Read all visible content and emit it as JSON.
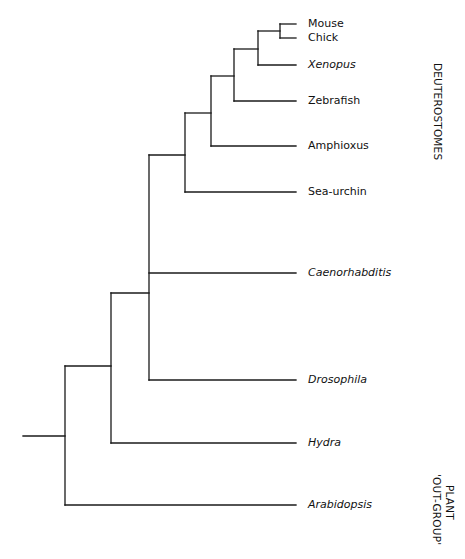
{
  "diagram": {
    "type": "phylogenetic-tree",
    "line_color": "#1a1a1a",
    "leaves": [
      {
        "label": "Mouse",
        "italic": false,
        "y": 24
      },
      {
        "label": "Chick",
        "italic": false,
        "y": 38
      },
      {
        "label": "Xenopus",
        "italic": true,
        "y": 65
      },
      {
        "label": "Zebrafish",
        "italic": false,
        "y": 101
      },
      {
        "label": "Amphioxus",
        "italic": false,
        "y": 146
      },
      {
        "label": "Sea-urchin",
        "italic": false,
        "y": 192
      },
      {
        "label": "Caenorhabditis",
        "italic": true,
        "y": 273
      },
      {
        "label": "Drosophila",
        "italic": true,
        "y": 380
      },
      {
        "label": "Hydra",
        "italic": true,
        "y": 443
      },
      {
        "label": "Arabidopsis",
        "italic": true,
        "y": 505
      }
    ],
    "group_labels": [
      {
        "label": "DEUTEROSTOMES"
      },
      {
        "line1": "PLANT",
        "line2": "'OUT-GROUP'"
      }
    ],
    "leaf_end_x": 296,
    "nodes": [
      {
        "name": "mouse-chick",
        "x": 280,
        "y_top": 24,
        "y_bottom": 38,
        "y_mid": 31
      },
      {
        "name": "amniote-xenopus",
        "x": 258,
        "y_top": 31,
        "y_bottom": 65,
        "y_mid": 49
      },
      {
        "name": "tetrapod-zebrafish",
        "x": 234,
        "y_top": 49,
        "y_bottom": 101,
        "y_mid": 76
      },
      {
        "name": "vertebrate-amphioxus",
        "x": 211,
        "y_top": 76,
        "y_bottom": 146,
        "y_mid": 113
      },
      {
        "name": "chordate-seaurchin",
        "x": 185,
        "y_top": 113,
        "y_bottom": 192,
        "y_mid": 155
      },
      {
        "name": "bilateria",
        "x": 149,
        "y_top": 155,
        "y_bottom": 380,
        "y_mid": 293
      },
      {
        "name": "metazoa",
        "x": 111,
        "y_top": 293,
        "y_bottom": 443,
        "y_mid": 366
      },
      {
        "name": "root",
        "x": 65,
        "y_top": 366,
        "y_bottom": 505,
        "y_mid": 436
      }
    ],
    "root_stem": {
      "x1": 23,
      "x2": 65,
      "y": 436
    }
  }
}
